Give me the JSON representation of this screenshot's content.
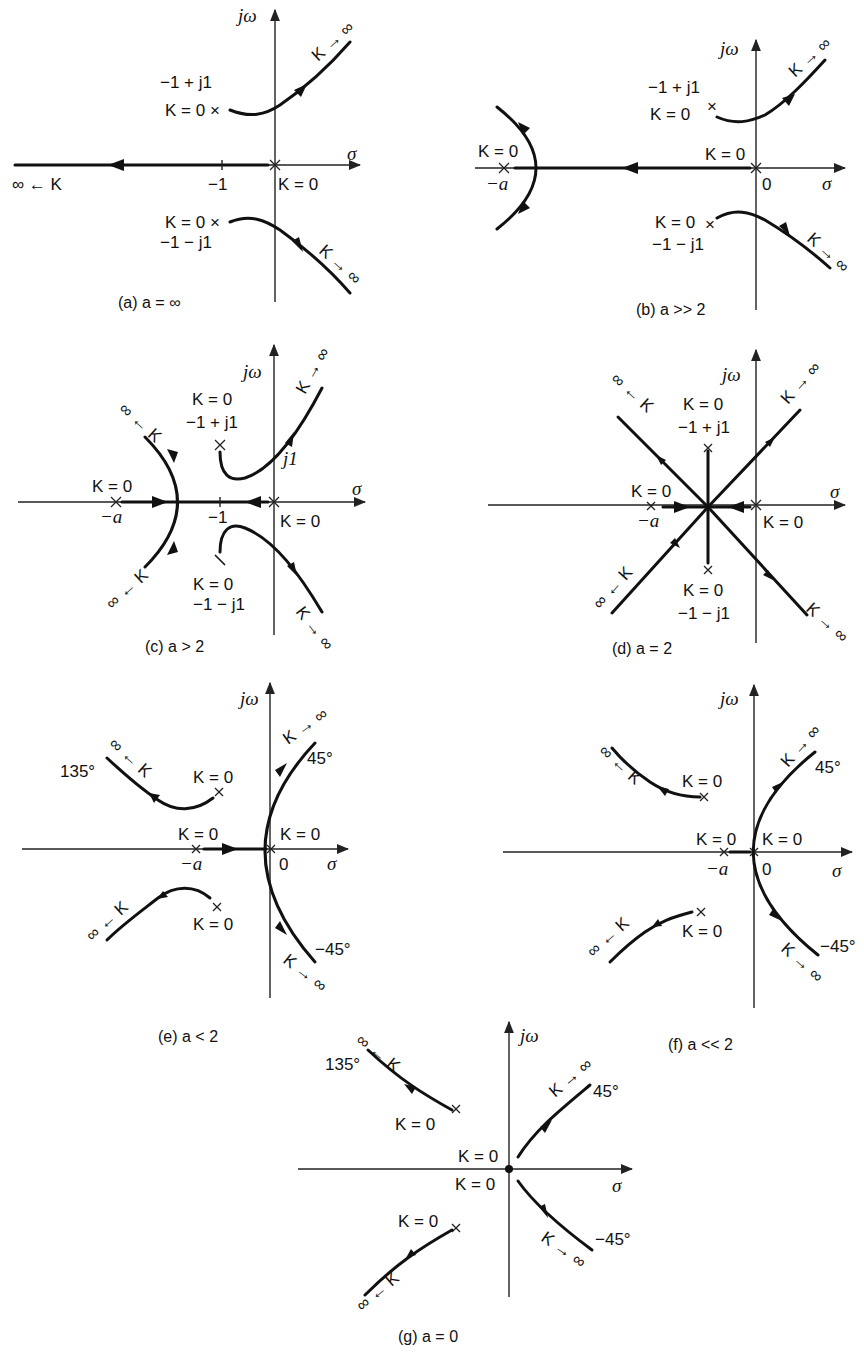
{
  "figure": {
    "axis_labels": {
      "imag": "jω",
      "real": "σ"
    },
    "panels": [
      {
        "id": "a",
        "caption": "(a) a = ∞",
        "labels": {
          "upper_pole_coord": "−1 + j1",
          "upper_pole_k": "K = 0 ×",
          "lower_pole_k": "K = 0 ×",
          "lower_pole_coord": "−1 − j1",
          "origin_k": "K = 0",
          "tick": "−1",
          "left_infinity": "∞ ← K",
          "upper_asym": "K → ∞",
          "lower_asym": "K → ∞"
        }
      },
      {
        "id": "b",
        "caption": "(b) a >> 2",
        "labels": {
          "upper_pole_coord": "−1 + j1",
          "upper_pole_k": "K = 0",
          "lower_pole_k": "K = 0",
          "lower_pole_coord": "−1 − j1",
          "origin_k": "K = 0",
          "origin": "0",
          "neg_a_k": "K = 0",
          "neg_a": "−a",
          "upper_asym": "K → ∞",
          "lower_asym": "K → ∞"
        }
      },
      {
        "id": "c",
        "caption": "(c) a > 2",
        "labels": {
          "upper_pole_k": "K = 0",
          "upper_pole_coord": "−1 + j1",
          "lower_pole_k": "K = 0",
          "lower_pole_coord": "−1 − j1",
          "origin_k": "K = 0",
          "neg_a_k": "K = 0",
          "neg_a": "−a",
          "tick": "−1",
          "j1": "j1",
          "upper_left_asym": "∞ ← K",
          "lower_left_asym": "∞ ← K",
          "upper_asym": "K → ∞",
          "lower_asym": "K → ∞"
        }
      },
      {
        "id": "d",
        "caption": "(d) a = 2",
        "labels": {
          "upper_pole_k": "K = 0",
          "upper_pole_coord": "−1 + j1",
          "lower_pole_k": "K = 0",
          "lower_pole_coord": "−1 − j1",
          "origin_k": "K = 0",
          "neg_a_k": "K = 0",
          "neg_a": "−a",
          "upper_left_asym": "∞ ← K",
          "lower_left_asym": "∞ ← K",
          "upper_asym": "K → ∞",
          "lower_asym": "K → ∞"
        }
      },
      {
        "id": "e",
        "caption": "(e) a < 2",
        "labels": {
          "upper_pole_k": "K = 0",
          "lower_pole_k": "K = 0",
          "origin_k": "K = 0",
          "origin": "0",
          "neg_a_k": "K = 0",
          "neg_a": "−a",
          "angle_135": "135°",
          "angle_45": "45°",
          "angle_neg45": "−45°",
          "upper_left_asym": "∞ ← K",
          "lower_left_asym": "∞ ← K",
          "upper_asym": "K → ∞",
          "lower_asym": "K → ∞"
        }
      },
      {
        "id": "f",
        "caption": "(f) a << 2",
        "labels": {
          "upper_pole_k": "K = 0",
          "lower_pole_k": "K = 0",
          "origin_k": "K = 0",
          "origin": "0",
          "neg_a_k": "K = 0",
          "neg_a": "−a",
          "angle_45": "45°",
          "angle_neg45": "−45°",
          "upper_left_asym": "∞ ← K",
          "lower_left_asym": "∞ ← K",
          "upper_asym": "K → ∞",
          "lower_asym": "K → ∞"
        }
      },
      {
        "id": "g",
        "caption": "(g) a = 0",
        "labels": {
          "upper_pole_k": "K = 0",
          "lower_pole_k": "K = 0",
          "origin_k_top": "K = 0",
          "origin_k_bottom": "K = 0",
          "angle_135": "135°",
          "angle_45": "45°",
          "angle_neg45": "−45°",
          "upper_left_asym": "∞ ← K",
          "lower_left_asym": "∞ ← K",
          "upper_asym": "K → ∞",
          "lower_asym": "K → ∞"
        }
      }
    ]
  }
}
